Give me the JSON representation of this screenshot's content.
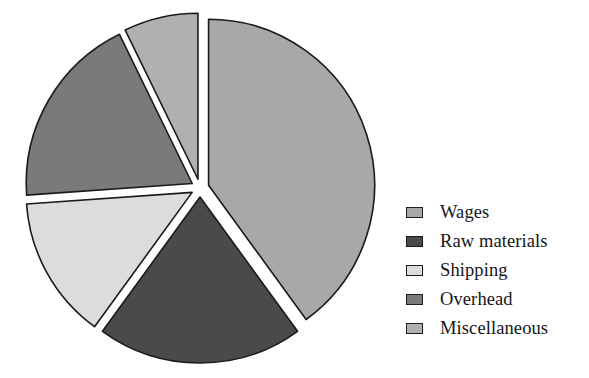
{
  "chart_data": {
    "type": "pie",
    "title": "",
    "subtitle": "",
    "xlabel": "",
    "ylabel": "",
    "grid": false,
    "legend_position": "right",
    "exploded": true,
    "start_angle_deg": 0,
    "direction": "clockwise",
    "categories": [
      "Wages",
      "Raw materials",
      "Shipping",
      "Overhead",
      "Miscellaneous"
    ],
    "values": [
      40,
      20,
      14,
      19,
      7
    ],
    "units": "percent",
    "slices": [
      {
        "label": "Wages",
        "value": 40,
        "color": "#a8a8a8",
        "start_deg": 0,
        "end_deg": 144,
        "exploded": true
      },
      {
        "label": "Raw materials",
        "value": 20,
        "color": "#4a4a4a",
        "start_deg": 144,
        "end_deg": 216,
        "exploded": true
      },
      {
        "label": "Shipping",
        "value": 14,
        "color": "#dcdcdc",
        "start_deg": 216,
        "end_deg": 266,
        "exploded": true
      },
      {
        "label": "Overhead",
        "value": 19,
        "color": "#7a7a7a",
        "start_deg": 266,
        "end_deg": 334,
        "exploded": true
      },
      {
        "label": "Miscellaneous",
        "value": 7,
        "color": "#b0b0b0",
        "start_deg": 334,
        "end_deg": 360,
        "exploded": true
      }
    ],
    "annotations": [],
    "tick_labels": [],
    "data_labels_shown": false
  },
  "legend": {
    "items": [
      {
        "label": "Wages",
        "color": "#a8a8a8"
      },
      {
        "label": "Raw materials",
        "color": "#4a4a4a"
      },
      {
        "label": "Shipping",
        "color": "#dcdcdc"
      },
      {
        "label": "Overhead",
        "color": "#7a7a7a"
      },
      {
        "label": "Miscellaneous",
        "color": "#b0b0b0"
      }
    ]
  },
  "style": {
    "background": "#ffffff",
    "outline_color": "#1a1a1a",
    "text_color": "#151515"
  }
}
